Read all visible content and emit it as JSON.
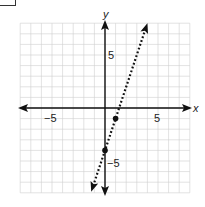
{
  "chart_data": {
    "type": "line",
    "title": "",
    "xlabel": "x",
    "ylabel": "y",
    "xlim": [
      -8,
      8
    ],
    "ylim": [
      -8,
      8
    ],
    "grid": true,
    "x_tick_labels": [
      {
        "value": -5,
        "label": "−5"
      },
      {
        "value": 5,
        "label": "5"
      }
    ],
    "y_tick_labels": [
      {
        "value": 5,
        "label": "5"
      },
      {
        "value": -5,
        "label": "−5"
      }
    ],
    "series": [
      {
        "name": "y = 3x - 4",
        "style": "dotted",
        "arrows": "both",
        "slope": 3,
        "intercept": -4,
        "x": [
          -1.3,
          4
        ],
        "y": [
          -7.9,
          8
        ]
      }
    ],
    "points": [
      {
        "x": 0,
        "y": -4
      },
      {
        "x": 1,
        "y": -1
      }
    ]
  },
  "labels": {
    "x_axis": "x",
    "y_axis": "y",
    "x_neg5": "−5",
    "x_pos5": "5",
    "y_pos5": "5",
    "y_neg5": "−5"
  }
}
